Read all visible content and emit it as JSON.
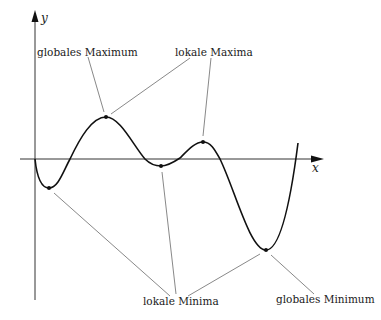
{
  "diagram": {
    "axes": {
      "x_label": "x",
      "y_label": "y"
    },
    "annotations": [
      {
        "id": "global-max",
        "label": "globales Maximum",
        "targets": [
          "global-max"
        ]
      },
      {
        "id": "local-maxima",
        "label": "lokale Maxima",
        "targets": [
          "global-max",
          "local-max"
        ]
      },
      {
        "id": "local-minima",
        "label": "lokale Minima",
        "targets": [
          "local-min-1",
          "local-min-2",
          "global-min"
        ]
      },
      {
        "id": "global-min",
        "label": "globales Minimum",
        "targets": [
          "global-min"
        ]
      }
    ],
    "points": [
      {
        "id": "local-min-1",
        "kind": "lokales Minimum"
      },
      {
        "id": "global-max",
        "kind": "globales Maximum"
      },
      {
        "id": "local-min-2",
        "kind": "lokales Minimum"
      },
      {
        "id": "local-max",
        "kind": "lokales Maximum"
      },
      {
        "id": "global-min",
        "kind": "globales Minimum"
      }
    ]
  }
}
